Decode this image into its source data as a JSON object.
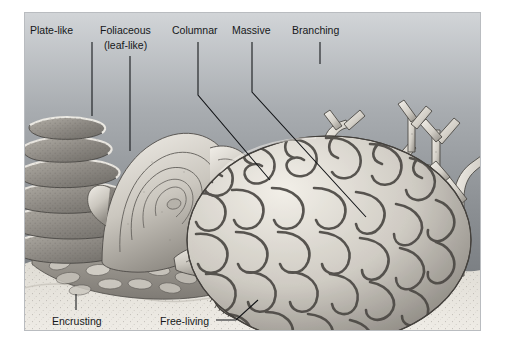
{
  "figure": {
    "medium": "grayscale scientific illustration",
    "frame": {
      "x": 24,
      "y": 12,
      "width": 457,
      "height": 319,
      "border_color": "#b9bcc0"
    },
    "background": {
      "water_top_color": "#cfd2d5",
      "water_mid_color": "#8f9397",
      "water_bottom_color": "#6e7276",
      "sand_color": "#e3e0d9",
      "coral_light": "#efece5",
      "coral_mid": "#bdb9b1",
      "coral_dark": "#6f6c67",
      "outline_color": "#3a3a38"
    }
  },
  "labels": {
    "plate_like": "Plate-like",
    "foliaceous_line1": "Foliaceous",
    "foliaceous_line2": "(leaf-like)",
    "columnar": "Columnar",
    "massive": "Massive",
    "branching": "Branching",
    "encrusting": "Encrusting",
    "free_living": "Free-living"
  },
  "label_positions": {
    "plate_like": {
      "text_x": 6,
      "text_y": 22,
      "leader": "M 68 30 L 68 104"
    },
    "foliaceous": {
      "text_x": 76,
      "text_y": 22,
      "text_y2": 36,
      "leader": "M 106 44 L 106 139"
    },
    "columnar": {
      "text_x": 148,
      "text_y": 22,
      "leader": "M 174 30 L 174 83 L 246 168"
    },
    "massive": {
      "text_x": 210,
      "text_y": 22,
      "leader": "M 228 30 L 228 80 L 342 205"
    },
    "branching": {
      "text_x": 270,
      "text_y": 22,
      "leader": "M 296 30 L 296 52"
    },
    "encrusting": {
      "text_x": 28,
      "text_y": 312,
      "leader": "M 52 298 L 52 282"
    },
    "free_living": {
      "text_x": 140,
      "text_y": 312,
      "leader": "M 192 308 L 212 308 L 234 288"
    }
  },
  "coral_forms": [
    {
      "id": "plate-like",
      "label": "Plate-like",
      "description": "stacked horizontal shelf-like plates at left"
    },
    {
      "id": "foliaceous",
      "label": "Foliaceous (leaf-like)",
      "description": "rose-like folded leafy whorls"
    },
    {
      "id": "columnar",
      "label": "Columnar",
      "description": "cluster of upright finger-like columns"
    },
    {
      "id": "massive",
      "label": "Massive",
      "description": "large rounded brain coral with maze ridges"
    },
    {
      "id": "branching",
      "label": "Branching",
      "description": "antler-like branched staghorn coral"
    },
    {
      "id": "encrusting",
      "label": "Encrusting",
      "description": "low bumpy mat spreading over rock"
    },
    {
      "id": "free-living",
      "label": "Free-living",
      "description": "unattached radially-ribbed mushroom coral disc"
    }
  ]
}
